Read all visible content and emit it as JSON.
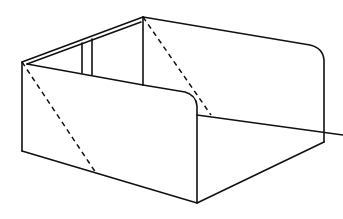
{
  "figure": {
    "type": "line-drawing",
    "stroke_color": "#111111",
    "background": "#ffffff",
    "vertices": {
      "top_back": [
        143,
        17
      ],
      "left_top": [
        22,
        62
      ],
      "left_bottom": [
        22,
        151
      ],
      "front_bottom": [
        197,
        203
      ],
      "right_bottom": [
        324,
        142
      ],
      "right_top_corner": [
        324,
        55
      ],
      "front_top_corner": [
        197,
        94
      ]
    },
    "dashed_lines": [
      {
        "from": [
          22,
          62
        ],
        "to": [
          96,
          173
        ]
      },
      {
        "from": [
          143,
          17
        ],
        "to": [
          211,
          115
        ]
      }
    ],
    "inner_panel_verticals": [
      {
        "x": 82,
        "y1": 42,
        "y2": 73
      },
      {
        "x": 92,
        "y1": 37,
        "y2": 75
      }
    ]
  }
}
